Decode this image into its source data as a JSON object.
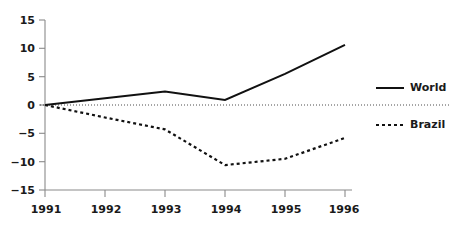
{
  "chart_data": {
    "type": "line",
    "title": "",
    "subtitle": "",
    "xlabel": "",
    "ylabel": "",
    "x": [
      "1991",
      "1992",
      "1993",
      "1994",
      "1995",
      "1996"
    ],
    "categories": [
      "1991",
      "1992",
      "1993",
      "1994",
      "1995",
      "1996"
    ],
    "series": [
      {
        "name": "World",
        "style": "solid",
        "color": "#111111",
        "values": [
          0,
          1.2,
          2.4,
          0.9,
          5.5,
          10.6
        ]
      },
      {
        "name": "Brazil",
        "style": "dotted",
        "color": "#111111",
        "values": [
          0,
          -2.2,
          -4.3,
          -10.6,
          -9.5,
          -5.8
        ]
      }
    ],
    "ylim": [
      -15,
      15
    ],
    "yticks": [
      15,
      10,
      5,
      0,
      -5,
      -10,
      -15
    ],
    "ytick_labels": [
      "15",
      "10",
      "5",
      "0",
      "−5",
      "−10",
      "−15"
    ],
    "xticks": [
      "1991",
      "1992",
      "1993",
      "1994",
      "1995",
      "1996"
    ],
    "grid": false,
    "zero_reference_line": true,
    "legend_position": "right"
  },
  "axes": {
    "y": {
      "ticks": [
        {
          "value": 15,
          "label": "15"
        },
        {
          "value": 10,
          "label": "10"
        },
        {
          "value": 5,
          "label": "5"
        },
        {
          "value": 0,
          "label": "0"
        },
        {
          "value": -5,
          "label": "−5"
        },
        {
          "value": -10,
          "label": "−10"
        },
        {
          "value": -15,
          "label": "−15"
        }
      ]
    },
    "x": {
      "ticks": [
        {
          "label": "1991"
        },
        {
          "label": "1992"
        },
        {
          "label": "1993"
        },
        {
          "label": "1994"
        },
        {
          "label": "1995"
        },
        {
          "label": "1996"
        }
      ]
    }
  },
  "legend": {
    "items": [
      {
        "label": "World",
        "style": "solid"
      },
      {
        "label": "Brazil",
        "style": "dotted"
      }
    ]
  },
  "colors": {
    "background": "#ffffff",
    "line": "#111111",
    "axis": "#8a8a8a",
    "text": "#1a1a1a",
    "zero_line": "#4d4d4d"
  }
}
